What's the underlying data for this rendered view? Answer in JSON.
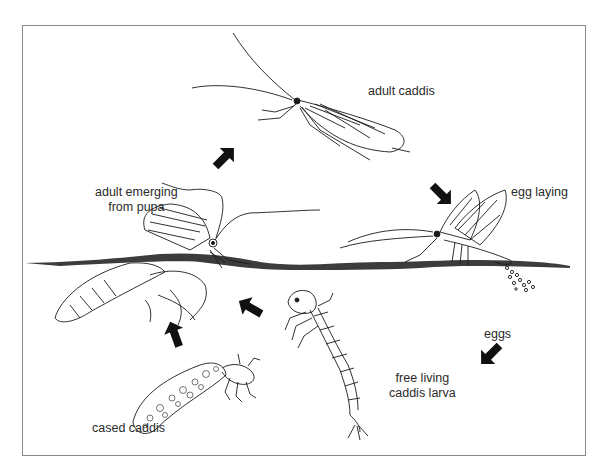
{
  "diagram": {
    "colors": {
      "ink": "#1a1a1a",
      "frame": "#8a8a8a",
      "water_surface": "#3c3c3c",
      "background": "#ffffff"
    },
    "stages": [
      {
        "id": "adult-caddis",
        "label": "adult caddis"
      },
      {
        "id": "egg-laying",
        "label": "egg laying"
      },
      {
        "id": "eggs",
        "label": "eggs"
      },
      {
        "id": "free-living-larva",
        "label_line1": "free living",
        "label_line2": "caddis larva"
      },
      {
        "id": "cased-caddis",
        "label": "cased caddis"
      },
      {
        "id": "adult-emerging",
        "label_line1": "adult emerging",
        "label_line2": "from pupa"
      }
    ],
    "arrows": [
      {
        "from": "adult-emerging",
        "to": "adult-caddis",
        "direction": "up-right"
      },
      {
        "from": "adult-caddis",
        "to": "egg-laying",
        "direction": "down-right"
      },
      {
        "from": "eggs",
        "to": "free-living-larva",
        "direction": "down-left"
      },
      {
        "from": "free-living-larva",
        "to": "adult-emerging",
        "direction": "up-left"
      },
      {
        "from": "cased-caddis",
        "to": "adult-emerging",
        "direction": "up"
      }
    ]
  }
}
